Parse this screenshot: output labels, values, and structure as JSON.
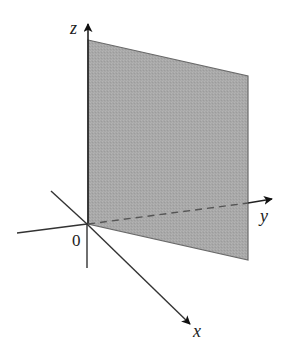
{
  "diagram": {
    "type": "3d-coordinate-axes-with-plane",
    "labels": {
      "z_axis": "z",
      "y_axis": "y",
      "x_axis": "x",
      "origin": "0"
    },
    "plane": {
      "description": "vertical plane through z-axis extending in the y direction (the yz-plane, x = 0)",
      "fill_color": "#a9a9a9",
      "edge_color": "#555555"
    },
    "axes": {
      "color": "#333333",
      "y_axis_style": "dashed behind plane, solid arrow beyond"
    }
  }
}
